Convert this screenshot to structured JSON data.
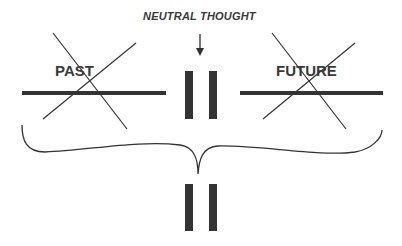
{
  "labels": {
    "neutral_thought": "NEUTRAL THOUGHT",
    "past": "PAST",
    "future": "FUTURE"
  },
  "colors": {
    "ink": "#333333",
    "background": "#ffffff"
  },
  "elements": {
    "past_crossed_out": true,
    "future_crossed_out": true,
    "pause_bars_top": 2,
    "pause_bars_bottom": 2,
    "brace": "curly brace spanning past, pause, future pointing down to pause bars"
  }
}
